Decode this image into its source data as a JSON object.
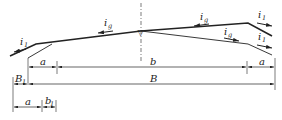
{
  "diagram": {
    "type": "road cross-section with crown and superelevation slopes",
    "colors": {
      "line": "#222222",
      "background": "#ffffff"
    },
    "slope_labels": [
      {
        "id": "left-shoulder",
        "main": "i",
        "sub": "1"
      },
      {
        "id": "left-pavement",
        "main": "i",
        "sub": "g"
      },
      {
        "id": "right-pavement-upper",
        "main": "i",
        "sub": "g"
      },
      {
        "id": "right-shoulder-upper",
        "main": "i",
        "sub": "1"
      },
      {
        "id": "right-pavement-lower",
        "main": "i",
        "sub": "g"
      },
      {
        "id": "right-shoulder-lower",
        "main": "i",
        "sub": "1"
      }
    ],
    "centerline_marker": "▽",
    "dimensions": {
      "row1": {
        "left": "a",
        "middle": "b",
        "right": "a"
      },
      "row2": {
        "left_main": "B",
        "left_sub": "1",
        "total": "B"
      },
      "row3": {
        "left": "a",
        "right_main": "b",
        "right_sub": "1"
      }
    }
  }
}
